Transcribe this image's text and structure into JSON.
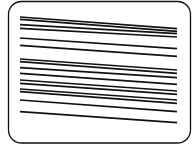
{
  "diagram": {
    "background": "#ffffff",
    "stroke_color": "#111111",
    "frame": {
      "x": 8.5,
      "y": 1.5,
      "width": 182,
      "height": 141.5,
      "radius": 13,
      "stroke_width": 1.3
    },
    "line_width": 1.7,
    "line_x_start": 20,
    "line_x_end": 177,
    "groups": [
      {
        "name": "upper-band",
        "lines": [
          {
            "y1": 17.0,
            "y2": 28.7
          },
          {
            "y1": 19.3,
            "y2": 31.3
          },
          {
            "y1": 24.7,
            "y2": 33.7
          },
          {
            "y1": 28.3,
            "y2": 37.0
          },
          {
            "y1": 38.0,
            "y2": 48.7
          },
          {
            "y1": 45.3,
            "y2": 56.3
          }
        ]
      },
      {
        "name": "lower-band",
        "lines": [
          {
            "y1": 59.0,
            "y2": 70.0
          },
          {
            "y1": 61.7,
            "y2": 73.3
          },
          {
            "y1": 67.7,
            "y2": 77.7
          },
          {
            "y1": 73.3,
            "y2": 84.3
          },
          {
            "y1": 80.0,
            "y2": 91.0
          },
          {
            "y1": 83.3,
            "y2": 94.3
          },
          {
            "y1": 89.0,
            "y2": 100.0
          },
          {
            "y1": 91.7,
            "y2": 103.3
          },
          {
            "y1": 100.0,
            "y2": 111.7
          },
          {
            "y1": 111.7,
            "y2": 122.7
          }
        ]
      }
    ]
  }
}
